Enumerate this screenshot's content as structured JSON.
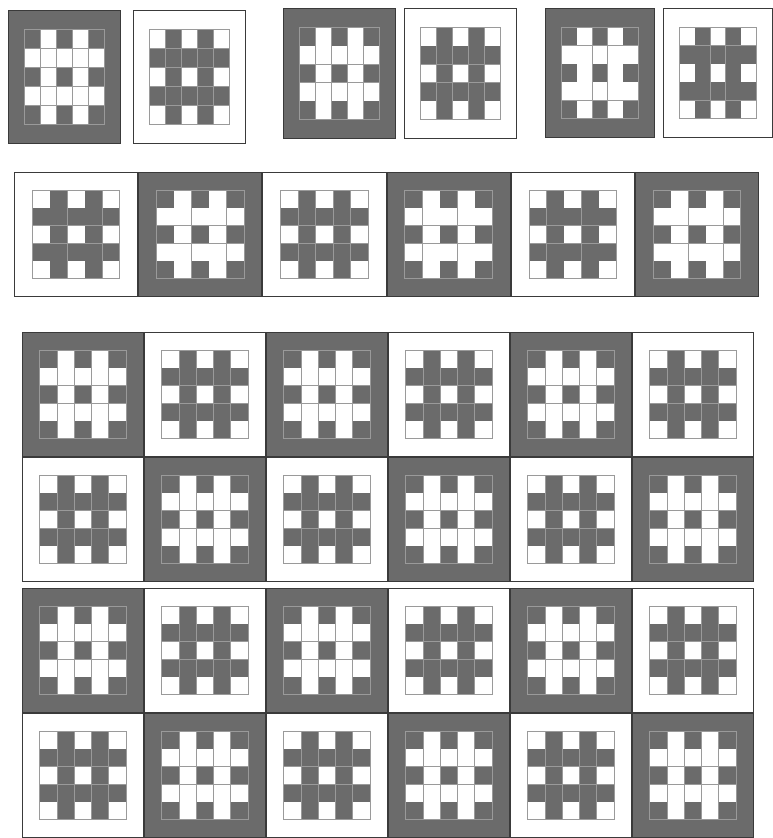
{
  "figure": {
    "kind": "quilt-block-layout-diagram",
    "colors": {
      "dark": "#6b6b6b",
      "light": "#ffffff",
      "outline": "#3a3a3a",
      "hairline": "#9a9a9a",
      "background": "#ffffff"
    },
    "block": {
      "grid": "5x5 inner pieced grid inside a 1-unit border",
      "inner_pattern_dark_colorway": [
        [
          "D",
          "L",
          "D",
          "L",
          "D"
        ],
        [
          "L",
          "L",
          "L",
          "L",
          "L"
        ],
        [
          "D",
          "L",
          "D",
          "L",
          "D"
        ],
        [
          "L",
          "L",
          "L",
          "L",
          "L"
        ],
        [
          "D",
          "L",
          "D",
          "L",
          "D"
        ]
      ],
      "inner_pattern_light_colorway": [
        [
          "L",
          "D",
          "L",
          "D",
          "L"
        ],
        [
          "D",
          "D",
          "D",
          "D",
          "D"
        ],
        [
          "L",
          "D",
          "L",
          "D",
          "L"
        ],
        [
          "D",
          "D",
          "D",
          "D",
          "D"
        ],
        [
          "L",
          "D",
          "L",
          "D",
          "L"
        ]
      ]
    },
    "sections": [
      {
        "name": "single-block-pairs",
        "rows": 1,
        "groups": [
          {
            "name": "pair-1",
            "blocks": [
              "dark",
              "light"
            ]
          },
          {
            "name": "pair-2",
            "blocks": [
              "dark",
              "light"
            ]
          },
          {
            "name": "pair-3",
            "blocks": [
              "dark",
              "light"
            ]
          }
        ]
      },
      {
        "name": "single-row-set",
        "rows": 1,
        "columns": 6,
        "blocks": [
          [
            "light",
            "dark",
            "light",
            "dark",
            "light",
            "dark"
          ]
        ]
      },
      {
        "name": "two-row-set-a",
        "rows": 2,
        "columns": 6,
        "blocks": [
          [
            "dark",
            "light",
            "dark",
            "light",
            "dark",
            "light"
          ],
          [
            "light",
            "dark",
            "light",
            "dark",
            "light",
            "dark"
          ]
        ]
      },
      {
        "name": "two-row-set-b",
        "rows": 2,
        "columns": 6,
        "blocks": [
          [
            "dark",
            "light",
            "dark",
            "light",
            "dark",
            "light"
          ],
          [
            "light",
            "dark",
            "light",
            "dark",
            "light",
            "dark"
          ]
        ]
      }
    ]
  }
}
